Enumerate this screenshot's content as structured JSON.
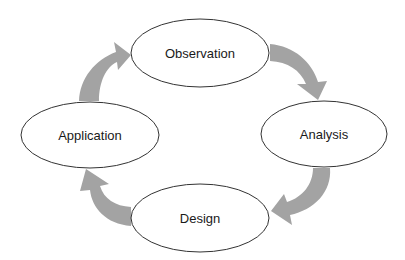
{
  "diagram": {
    "type": "cycle",
    "nodes": [
      {
        "id": "observation",
        "label": "Observation",
        "cx": 200,
        "cy": 53,
        "rx": 69,
        "ry": 34
      },
      {
        "id": "analysis",
        "label": "Analysis",
        "cx": 324,
        "cy": 134,
        "rx": 63,
        "ry": 33
      },
      {
        "id": "design",
        "label": "Design",
        "cx": 200,
        "cy": 218,
        "rx": 69,
        "ry": 34
      },
      {
        "id": "application",
        "label": "Application",
        "cx": 90,
        "cy": 135,
        "rx": 69,
        "ry": 33
      }
    ],
    "edges": [
      {
        "from": "observation",
        "to": "analysis"
      },
      {
        "from": "analysis",
        "to": "design"
      },
      {
        "from": "design",
        "to": "application"
      },
      {
        "from": "application",
        "to": "observation"
      }
    ],
    "colors": {
      "arrow": "#a3a3a3",
      "node_stroke": "#333333",
      "node_fill": "#ffffff",
      "text": "#1a1a1a",
      "background": "#ffffff"
    }
  }
}
